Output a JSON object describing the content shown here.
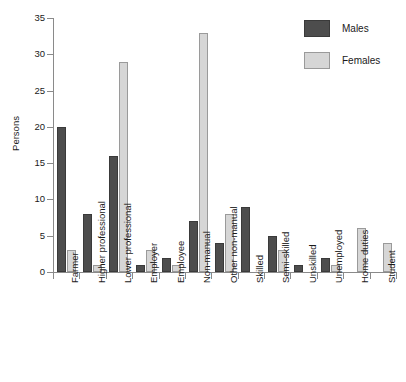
{
  "chart_data": {
    "type": "bar",
    "title": "",
    "subtitle": "",
    "xlabel": "",
    "ylabel": "Persons",
    "ylim": [
      0,
      35
    ],
    "yticks": [
      0,
      5,
      10,
      15,
      20,
      25,
      30,
      35
    ],
    "grid": false,
    "legend_position": "top-right",
    "categories": [
      "Farmer",
      "Higher professional",
      "Lower professional",
      "Employer",
      "Employee",
      "Non-manual",
      "Other non-manual",
      "Skilled",
      "Semi-skilled",
      "Unskilled",
      "Unemployed",
      "Home duties",
      "Student"
    ],
    "series": [
      {
        "name": "Males",
        "color": "#4d4d4d",
        "values": [
          20,
          8,
          16,
          1,
          2,
          7,
          4,
          9,
          5,
          1,
          2,
          0,
          0
        ]
      },
      {
        "name": "Females",
        "color": "#d6d6d6",
        "values": [
          3,
          1,
          29,
          3,
          1,
          33,
          8,
          0,
          3,
          0,
          1,
          6,
          4
        ]
      }
    ]
  },
  "legend": {
    "items": [
      {
        "label": "Males",
        "swatch": "males"
      },
      {
        "label": "Females",
        "swatch": "females"
      }
    ]
  },
  "axis": {
    "y_title": "Persons"
  }
}
